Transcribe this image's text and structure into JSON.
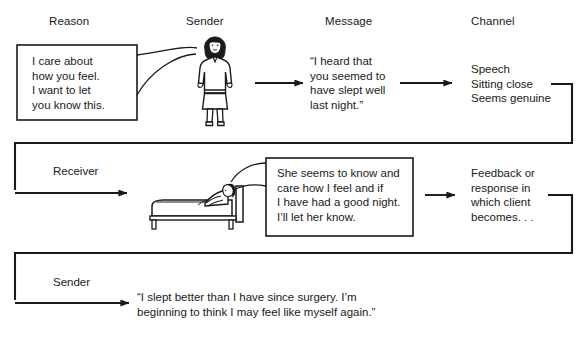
{
  "diagram": {
    "columns": [
      {
        "label": "Reason"
      },
      {
        "label": "Sender"
      },
      {
        "label": "Message"
      },
      {
        "label": "Channel"
      }
    ],
    "rows": [
      {
        "name": "row-1",
        "role_label": "",
        "thought_box": "I care about\nhow you feel.\nI want to let\nyou know this.",
        "figure": "standing-woman-figure",
        "message": "“I heard that\nyou seemed to\nhave slept well\nlast night.”",
        "channel": "Speech\nSitting close\nSeems genuine"
      },
      {
        "name": "row-2",
        "role_label": "Receiver",
        "thought_box": "She seems to know and\ncare how I feel and if\nI have had a good night.\nI’ll let her know.",
        "figure": "patient-in-bed-figure",
        "message": "",
        "channel": "Feedback or\nresponse in\nwhich client\nbecomes. . ."
      },
      {
        "name": "row-3",
        "role_label": "Sender",
        "thought_box": "",
        "figure": "",
        "message": "“I slept better than I have since surgery. I’m\nbeginning to think I may feel like myself again.”",
        "channel": ""
      }
    ],
    "colors": {
      "stroke": "#1a1a1a",
      "background": "#ffffff",
      "text": "#1a1a1a",
      "hair": "#1a1a1a"
    }
  }
}
